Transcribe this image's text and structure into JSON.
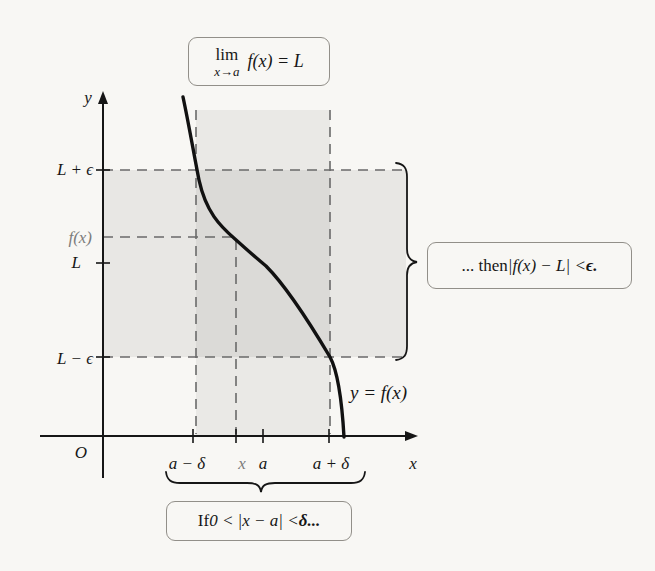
{
  "figure_title": {
    "lim": "lim",
    "sub": "x→a",
    "expr": "f(x) = L"
  },
  "axis": {
    "y_label": "y",
    "x_label": "x",
    "origin_label": "O"
  },
  "y_axis_labels": {
    "upper": "L + ϵ",
    "fx": "f(x)",
    "limit": "L",
    "lower": "L − ϵ"
  },
  "x_axis_labels": {
    "a_minus_delta": "a − δ",
    "x_point": "x",
    "a": "a",
    "a_plus_delta": "a + δ"
  },
  "curve_label": "y = f(x)",
  "then_box": {
    "prefix": "... then ",
    "math": "|f(x) − L| < ",
    "epsilon": "ϵ."
  },
  "if_box": {
    "prefix": "If ",
    "math": "0 < |x − a| < ",
    "delta": "δ..."
  },
  "colors": {
    "background": "#f8f7f4",
    "band_vertical": "#eae9e6",
    "band_horizontal": "#e8e7e4",
    "band_overlap": "#dbdad7",
    "axis": "#161616",
    "dashed": "#6a6a6a",
    "curve": "#111111",
    "muted_label": "#7c7c7c",
    "box_border": "#928f89"
  }
}
